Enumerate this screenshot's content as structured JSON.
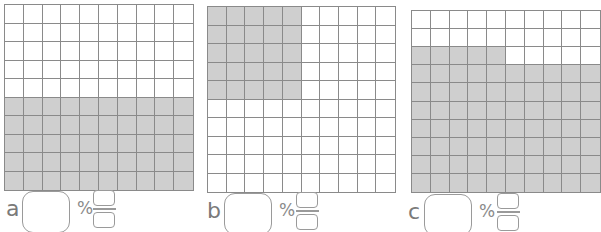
{
  "colors": {
    "grid_line": "#8a8a8a",
    "shaded": "#cfcfcf",
    "unshaded": "#ffffff",
    "label": "#7a7a7a"
  },
  "grid_size": {
    "rows": 10,
    "cols": 10
  },
  "panels": [
    {
      "id": "a",
      "letter": "a",
      "percent_value": "",
      "percent_symbol": "%",
      "fraction_numerator": "",
      "fraction_denominator": "",
      "shaded_count": 50,
      "shading_description": "bottom 5 rows fully shaded",
      "shaded_rows": [
        [
          0,
          0,
          0,
          0,
          0,
          0,
          0,
          0,
          0,
          0
        ],
        [
          0,
          0,
          0,
          0,
          0,
          0,
          0,
          0,
          0,
          0
        ],
        [
          0,
          0,
          0,
          0,
          0,
          0,
          0,
          0,
          0,
          0
        ],
        [
          0,
          0,
          0,
          0,
          0,
          0,
          0,
          0,
          0,
          0
        ],
        [
          0,
          0,
          0,
          0,
          0,
          0,
          0,
          0,
          0,
          0
        ],
        [
          1,
          1,
          1,
          1,
          1,
          1,
          1,
          1,
          1,
          1
        ],
        [
          1,
          1,
          1,
          1,
          1,
          1,
          1,
          1,
          1,
          1
        ],
        [
          1,
          1,
          1,
          1,
          1,
          1,
          1,
          1,
          1,
          1
        ],
        [
          1,
          1,
          1,
          1,
          1,
          1,
          1,
          1,
          1,
          1
        ],
        [
          1,
          1,
          1,
          1,
          1,
          1,
          1,
          1,
          1,
          1
        ]
      ]
    },
    {
      "id": "b",
      "letter": "b",
      "percent_value": "",
      "percent_symbol": "%",
      "fraction_numerator": "",
      "fraction_denominator": "",
      "shaded_count": 25,
      "shading_description": "top-left 5x5 block shaded",
      "shaded_rows": [
        [
          1,
          1,
          1,
          1,
          1,
          0,
          0,
          0,
          0,
          0
        ],
        [
          1,
          1,
          1,
          1,
          1,
          0,
          0,
          0,
          0,
          0
        ],
        [
          1,
          1,
          1,
          1,
          1,
          0,
          0,
          0,
          0,
          0
        ],
        [
          1,
          1,
          1,
          1,
          1,
          0,
          0,
          0,
          0,
          0
        ],
        [
          1,
          1,
          1,
          1,
          1,
          0,
          0,
          0,
          0,
          0
        ],
        [
          0,
          0,
          0,
          0,
          0,
          0,
          0,
          0,
          0,
          0
        ],
        [
          0,
          0,
          0,
          0,
          0,
          0,
          0,
          0,
          0,
          0
        ],
        [
          0,
          0,
          0,
          0,
          0,
          0,
          0,
          0,
          0,
          0
        ],
        [
          0,
          0,
          0,
          0,
          0,
          0,
          0,
          0,
          0,
          0
        ],
        [
          0,
          0,
          0,
          0,
          0,
          0,
          0,
          0,
          0,
          0
        ]
      ]
    },
    {
      "id": "c",
      "letter": "c",
      "percent_value": "",
      "percent_symbol": "%",
      "fraction_numerator": "",
      "fraction_denominator": "",
      "shaded_count": 75,
      "shading_description": "top 2 rows white, row 3 left half shaded, rows 4-10 fully shaded",
      "shaded_rows": [
        [
          0,
          0,
          0,
          0,
          0,
          0,
          0,
          0,
          0,
          0
        ],
        [
          0,
          0,
          0,
          0,
          0,
          0,
          0,
          0,
          0,
          0
        ],
        [
          1,
          1,
          1,
          1,
          1,
          0,
          0,
          0,
          0,
          0
        ],
        [
          1,
          1,
          1,
          1,
          1,
          1,
          1,
          1,
          1,
          1
        ],
        [
          1,
          1,
          1,
          1,
          1,
          1,
          1,
          1,
          1,
          1
        ],
        [
          1,
          1,
          1,
          1,
          1,
          1,
          1,
          1,
          1,
          1
        ],
        [
          1,
          1,
          1,
          1,
          1,
          1,
          1,
          1,
          1,
          1
        ],
        [
          1,
          1,
          1,
          1,
          1,
          1,
          1,
          1,
          1,
          1
        ],
        [
          1,
          1,
          1,
          1,
          1,
          1,
          1,
          1,
          1,
          1
        ],
        [
          1,
          1,
          1,
          1,
          1,
          1,
          1,
          1,
          1,
          1
        ]
      ]
    }
  ]
}
